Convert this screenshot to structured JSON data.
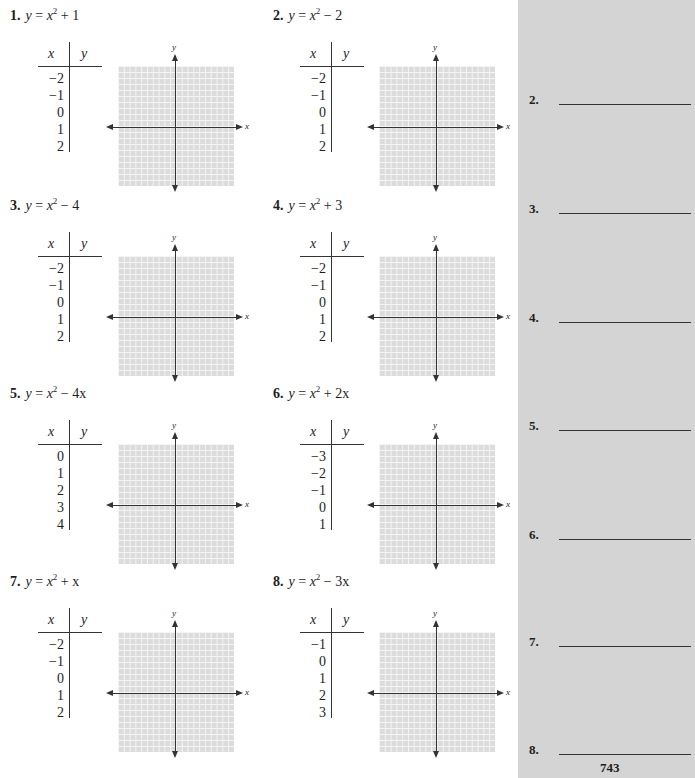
{
  "problems": [
    {
      "number": "1.",
      "lhs": "y",
      "equals": " = ",
      "var": "x",
      "exp": "2",
      "rest": " + 1",
      "table": {
        "x_header": "x",
        "y_header": "y",
        "x_values": [
          "−2",
          "−1",
          "0",
          "1",
          "2"
        ]
      },
      "graph": {
        "x_label": "x",
        "y_label": "y"
      }
    },
    {
      "number": "2.",
      "lhs": "y",
      "equals": " = ",
      "var": "x",
      "exp": "2",
      "rest": " − 2",
      "table": {
        "x_header": "x",
        "y_header": "y",
        "x_values": [
          "−2",
          "−1",
          "0",
          "1",
          "2"
        ]
      },
      "graph": {
        "x_label": "x",
        "y_label": "y"
      }
    },
    {
      "number": "3.",
      "lhs": "y",
      "equals": " = ",
      "var": "x",
      "exp": "2",
      "rest": " − 4",
      "table": {
        "x_header": "x",
        "y_header": "y",
        "x_values": [
          "−2",
          "−1",
          "0",
          "1",
          "2"
        ]
      },
      "graph": {
        "x_label": "x",
        "y_label": "y"
      }
    },
    {
      "number": "4.",
      "lhs": "y",
      "equals": " = ",
      "var": "x",
      "exp": "2",
      "rest": " + 3",
      "table": {
        "x_header": "x",
        "y_header": "y",
        "x_values": [
          "−2",
          "−1",
          "0",
          "1",
          "2"
        ]
      },
      "graph": {
        "x_label": "x",
        "y_label": "y"
      }
    },
    {
      "number": "5.",
      "lhs": "y",
      "equals": " = ",
      "var": "x",
      "exp": "2",
      "rest": " − 4x",
      "table": {
        "x_header": "x",
        "y_header": "y",
        "x_values": [
          "0",
          "1",
          "2",
          "3",
          "4"
        ]
      },
      "graph": {
        "x_label": "x",
        "y_label": "y"
      }
    },
    {
      "number": "6.",
      "lhs": "y",
      "equals": " = ",
      "var": "x",
      "exp": "2",
      "rest": " + 2x",
      "table": {
        "x_header": "x",
        "y_header": "y",
        "x_values": [
          "−3",
          "−2",
          "−1",
          "0",
          "1"
        ]
      },
      "graph": {
        "x_label": "x",
        "y_label": "y"
      }
    },
    {
      "number": "7.",
      "lhs": "y",
      "equals": " = ",
      "var": "x",
      "exp": "2",
      "rest": " + x",
      "table": {
        "x_header": "x",
        "y_header": "y",
        "x_values": [
          "−2",
          "−1",
          "0",
          "1",
          "2"
        ]
      },
      "graph": {
        "x_label": "x",
        "y_label": "y"
      }
    },
    {
      "number": "8.",
      "lhs": "y",
      "equals": " = ",
      "var": "x",
      "exp": "2",
      "rest": " − 3x",
      "table": {
        "x_header": "x",
        "y_header": "y",
        "x_values": [
          "−1",
          "0",
          "1",
          "2",
          "3"
        ]
      },
      "graph": {
        "x_label": "x",
        "y_label": "y"
      }
    }
  ],
  "answers": [
    {
      "label": "2."
    },
    {
      "label": "3."
    },
    {
      "label": "4."
    },
    {
      "label": "5."
    },
    {
      "label": "6."
    },
    {
      "label": "7."
    },
    {
      "label": "8."
    }
  ],
  "page_number": "743",
  "colors": {
    "grid_fill": "#dcdcdc",
    "panel_bg": "#d4d4d4",
    "ink": "#1e1e1e"
  }
}
